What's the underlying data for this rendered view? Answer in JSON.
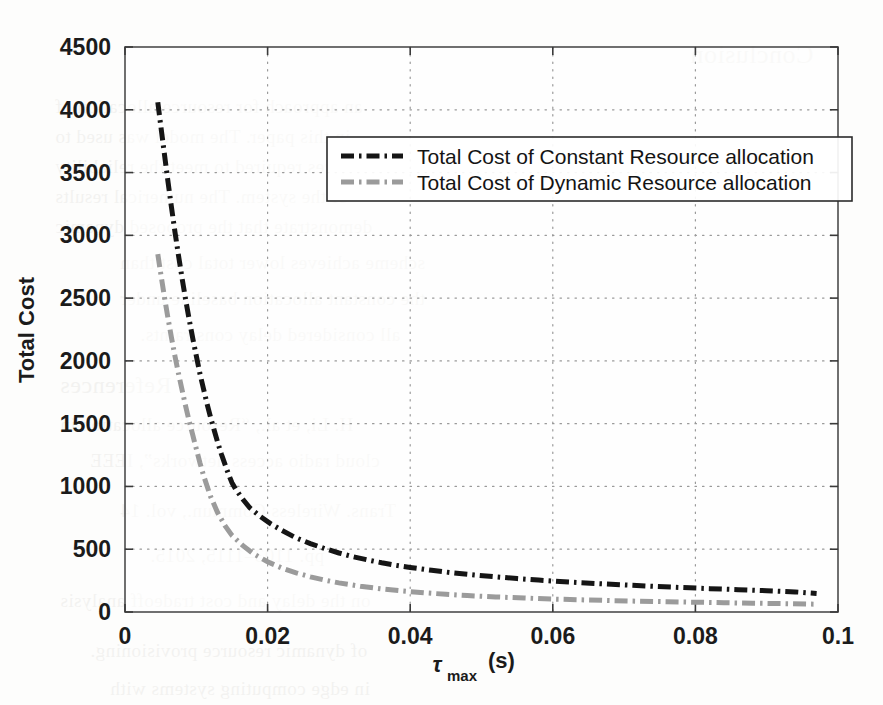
{
  "chart_data": {
    "type": "line",
    "title": "",
    "xlabel": "τ_max (s)",
    "xlabel_base": "τ",
    "xlabel_subscript": "max",
    "xlabel_unit": "(s)",
    "ylabel": "Total Cost",
    "xlim": [
      0,
      0.1
    ],
    "ylim": [
      0,
      4500
    ],
    "grid": true,
    "grid_style": "dotted",
    "legend_position": "upper-center-right",
    "xticks": [
      "0",
      "0.02",
      "0.04",
      "0.06",
      "0.08",
      "0.1"
    ],
    "xtick_values": [
      0,
      0.02,
      0.04,
      0.06,
      0.08,
      0.1
    ],
    "yticks": [
      "0",
      "500",
      "1000",
      "1500",
      "2000",
      "2500",
      "3000",
      "3500",
      "4000",
      "4500"
    ],
    "ytick_values": [
      0,
      500,
      1000,
      1500,
      2000,
      2500,
      3000,
      3500,
      4000,
      4500
    ],
    "series": [
      {
        "name": "Total Cost of Constant Resource allocation",
        "color": "#151515",
        "linestyle": "dash-dot",
        "linewidth": 5,
        "x": [
          0.0046,
          0.005,
          0.0055,
          0.006,
          0.0065,
          0.007,
          0.0075,
          0.008,
          0.0085,
          0.009,
          0.0095,
          0.01,
          0.0105,
          0.011,
          0.0115,
          0.012,
          0.0125,
          0.013,
          0.0135,
          0.014,
          0.0145,
          0.015,
          0.0155,
          0.0165,
          0.0175,
          0.019,
          0.0205,
          0.022,
          0.024,
          0.026,
          0.028,
          0.03,
          0.032,
          0.034,
          0.036,
          0.038,
          0.04,
          0.043,
          0.046,
          0.049,
          0.052,
          0.055,
          0.058,
          0.061,
          0.064,
          0.067,
          0.07,
          0.074,
          0.078,
          0.082,
          0.086,
          0.09,
          0.094,
          0.097
        ],
        "y": [
          4060,
          3880,
          3660,
          3440,
          3230,
          3030,
          2840,
          2660,
          2490,
          2330,
          2180,
          2040,
          1900,
          1780,
          1660,
          1550,
          1450,
          1350,
          1260,
          1180,
          1100,
          1030,
          980,
          900,
          830,
          760,
          700,
          650,
          590,
          545,
          505,
          470,
          440,
          415,
          392,
          372,
          355,
          332,
          312,
          295,
          280,
          266,
          254,
          243,
          233,
          224,
          216,
          205,
          195,
          186,
          178,
          170,
          160,
          148
        ]
      },
      {
        "name": "Total Cost of Dynamic Resource allocation",
        "color": "#9b9b9b",
        "linestyle": "dash-dot",
        "linewidth": 5,
        "x": [
          0.0046,
          0.005,
          0.0055,
          0.006,
          0.0065,
          0.007,
          0.0075,
          0.008,
          0.0085,
          0.009,
          0.0095,
          0.01,
          0.0105,
          0.011,
          0.012,
          0.013,
          0.014,
          0.015,
          0.0165,
          0.018,
          0.02,
          0.022,
          0.024,
          0.026,
          0.028,
          0.03,
          0.033,
          0.036,
          0.039,
          0.042,
          0.045,
          0.048,
          0.052,
          0.056,
          0.06,
          0.064,
          0.068,
          0.072,
          0.076,
          0.08,
          0.084,
          0.088,
          0.092,
          0.097
        ],
        "y": [
          2850,
          2700,
          2520,
          2350,
          2190,
          2040,
          1900,
          1770,
          1640,
          1520,
          1410,
          1300,
          1190,
          1090,
          920,
          790,
          690,
          610,
          530,
          465,
          400,
          350,
          312,
          280,
          254,
          232,
          205,
          184,
          167,
          153,
          141,
          131,
          120,
          111,
          103,
          97,
          91,
          86,
          82,
          78,
          74,
          70,
          67,
          62
        ]
      }
    ]
  },
  "ghost_text": {
    "lines": [
      {
        "text": "Conclusion",
        "x": 690,
        "y": 40,
        "size": 26
      },
      {
        "text": "an  approach  for  resource  allocation  of",
        "x": 55,
        "y": 96,
        "size": 19
      },
      {
        "text": "in this paper.  The model  was  used  to",
        "x": 55,
        "y": 126,
        "size": 19
      },
      {
        "text": "resources required to meet the reliability",
        "x": 55,
        "y": 156,
        "size": 19
      },
      {
        "text": "of  the  system.  The  numerical  results",
        "x": 55,
        "y": 186,
        "size": 19
      },
      {
        "text": "demonstrate  that  the  proposed  dynamic",
        "x": 55,
        "y": 216,
        "size": 19
      },
      {
        "text": "scheme achieves  lower  total  cost  than",
        "x": 120,
        "y": 252,
        "size": 19
      },
      {
        "text": "the  constant  allocation  baseline  under",
        "x": 120,
        "y": 288,
        "size": 19
      },
      {
        "text": "all  considered  delay  constraints.",
        "x": 140,
        "y": 324,
        "size": 19
      },
      {
        "text": "References",
        "x": 60,
        "y": 372,
        "size": 24
      },
      {
        "text": "H.  Li,  et  al.,  “Resource  allocation  in",
        "x": 60,
        "y": 414,
        "size": 19
      },
      {
        "text": "cloud  radio  access  networks”,  IEEE",
        "x": 90,
        "y": 450,
        "size": 19
      },
      {
        "text": "Trans.  Wireless  Commun.,  vol.  14",
        "x": 120,
        "y": 500,
        "size": 19
      },
      {
        "text": "pp.  1103–1115,  2015.",
        "x": 150,
        "y": 545,
        "size": 19
      },
      {
        "text": "on  the  delay  and  cost  tradeoff  analysis",
        "x": 60,
        "y": 590,
        "size": 19
      },
      {
        "text": "of  dynamic  resource  provisioning.",
        "x": 90,
        "y": 640,
        "size": 19
      },
      {
        "text": "in  edge  computing  systems  with",
        "x": 110,
        "y": 678,
        "size": 19
      }
    ]
  },
  "plot_geometry": {
    "left": 125,
    "right": 838,
    "top": 47,
    "bottom": 612
  },
  "legend_box": {
    "x": 327,
    "y": 137,
    "width": 525,
    "height": 64
  }
}
